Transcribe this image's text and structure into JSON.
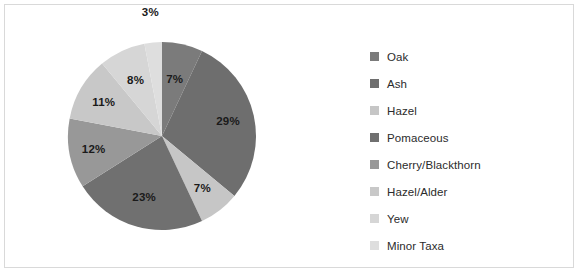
{
  "chart_data": {
    "type": "pie",
    "title": "",
    "subtitle": "",
    "xlabel": "",
    "ylabel": "",
    "legend_position": "right",
    "grid": false,
    "start_angle_deg": 0,
    "direction": "clockwise",
    "categories": [
      "Oak",
      "Ash",
      "Hazel",
      "Pomaceous",
      "Cherry/Blackthorn",
      "Hazel/Alder",
      "Yew",
      "Minor Taxa"
    ],
    "values": [
      7,
      29,
      7,
      23,
      12,
      11,
      8,
      3
    ],
    "value_unit": "%",
    "data_labels": [
      "7%",
      "29%",
      "7%",
      "23%",
      "12%",
      "11%",
      "8%",
      "3%"
    ],
    "colors": [
      "#7b7b7b",
      "#6e6e6e",
      "#c6c6c6",
      "#707070",
      "#989898",
      "#c8c8c8",
      "#d6d6d6",
      "#dedede"
    ],
    "slices": [
      {
        "label": "Oak",
        "value": 7,
        "data_label": "7%",
        "color": "#7b7b7b"
      },
      {
        "label": "Ash",
        "value": 29,
        "data_label": "29%",
        "color": "#6e6e6e"
      },
      {
        "label": "Hazel",
        "value": 7,
        "data_label": "7%",
        "color": "#c6c6c6"
      },
      {
        "label": "Pomaceous",
        "value": 23,
        "data_label": "23%",
        "color": "#707070"
      },
      {
        "label": "Cherry/Blackthorn",
        "value": 12,
        "data_label": "12%",
        "color": "#989898"
      },
      {
        "label": "Hazel/Alder",
        "value": 11,
        "data_label": "11%",
        "color": "#c8c8c8"
      },
      {
        "label": "Yew",
        "value": 8,
        "data_label": "8%",
        "color": "#d6d6d6"
      },
      {
        "label": "Minor Taxa",
        "value": 3,
        "data_label": "3%",
        "color": "#dedede"
      }
    ]
  },
  "style": {
    "border_color": "#d9d9d9",
    "background": "#ffffff",
    "label_color": "#1a1a1a",
    "legend_text_color": "#2b2b2b"
  }
}
